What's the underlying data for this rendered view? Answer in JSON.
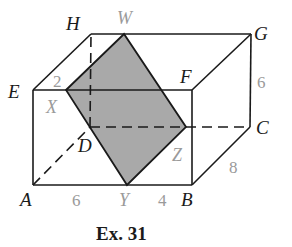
{
  "figure": {
    "caption": "Ex. 31",
    "vertices": {
      "A": "A",
      "B": "B",
      "C": "C",
      "D": "D",
      "E": "E",
      "F": "F",
      "G": "G",
      "H": "H"
    },
    "section_points": {
      "W": "W",
      "X": "X",
      "Y": "Y",
      "Z": "Z"
    },
    "dimensions": {
      "EX": "2",
      "AY": "6",
      "YB": "4",
      "BC": "8",
      "CG": "6"
    },
    "colors": {
      "section_fill": "#a9a9a9",
      "edge": "#1a1a1a",
      "gray_label": "#9a9a9a"
    }
  }
}
